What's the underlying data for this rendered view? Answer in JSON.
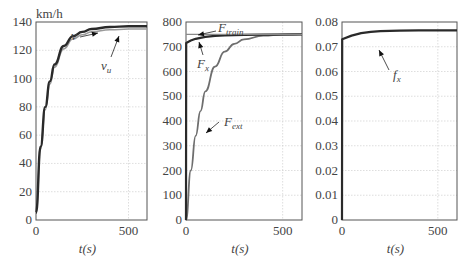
{
  "chart_data": [
    {
      "type": "line",
      "title": "",
      "ylabel": "km/h",
      "xlabel": "t(s)",
      "xlim": [
        0,
        600
      ],
      "ylim": [
        0,
        140
      ],
      "xticks": [
        "0",
        "500"
      ],
      "yticks": [
        "0",
        "20",
        "40",
        "60",
        "80",
        "100",
        "120",
        "140"
      ],
      "grid": true,
      "annotations": [
        "v",
        "v_u"
      ],
      "series": [
        {
          "name": "v",
          "x": [
            0,
            25,
            50,
            75,
            100,
            150,
            200,
            250,
            300,
            400,
            500,
            600
          ],
          "values": [
            5,
            52,
            80,
            98,
            110,
            123,
            130,
            133,
            135,
            136.5,
            137,
            137
          ]
        },
        {
          "name": "v_u",
          "x": [
            0,
            25,
            50,
            75,
            100,
            150,
            200,
            250,
            300,
            400,
            500,
            600
          ],
          "values": [
            5,
            50,
            78,
            96,
            108,
            121,
            128,
            131,
            133,
            134.5,
            135,
            135
          ]
        }
      ]
    },
    {
      "type": "line",
      "title": "",
      "ylabel": "",
      "xlabel": "t(s)",
      "xlim": [
        0,
        600
      ],
      "ylim": [
        0,
        800
      ],
      "xticks": [
        "0",
        "500"
      ],
      "yticks": [
        "0",
        "100",
        "200",
        "300",
        "400",
        "500",
        "600",
        "700",
        "800"
      ],
      "grid": true,
      "annotations": [
        "F_train",
        "F_x",
        "F_ext"
      ],
      "series": [
        {
          "name": "F_train",
          "x": [
            0,
            600
          ],
          "values": [
            750,
            750
          ]
        },
        {
          "name": "F_x",
          "x": [
            0,
            1,
            25,
            50,
            100,
            150,
            200,
            300,
            400,
            600
          ],
          "values": [
            0,
            715,
            725,
            732,
            740,
            744,
            746,
            748,
            749,
            750
          ]
        },
        {
          "name": "F_ext",
          "x": [
            0,
            25,
            50,
            75,
            100,
            150,
            200,
            250,
            300,
            400,
            500,
            600
          ],
          "values": [
            0,
            200,
            340,
            440,
            520,
            620,
            680,
            712,
            730,
            745,
            749,
            750
          ]
        }
      ]
    },
    {
      "type": "line",
      "title": "",
      "ylabel": "",
      "xlabel": "t(s)",
      "xlim": [
        0,
        600
      ],
      "ylim": [
        0,
        0.08
      ],
      "xticks": [
        "0",
        "500"
      ],
      "yticks": [
        "0",
        "0.01",
        "0.02",
        "0.03",
        "0.04",
        "0.05",
        "0.06",
        "0.07",
        "0.08"
      ],
      "grid": true,
      "annotations": [
        "f_x"
      ],
      "series": [
        {
          "name": "f_x",
          "x": [
            0,
            1,
            50,
            100,
            150,
            200,
            300,
            400,
            600
          ],
          "values": [
            0,
            0.073,
            0.0745,
            0.0755,
            0.076,
            0.0763,
            0.0765,
            0.0766,
            0.0766
          ]
        }
      ]
    }
  ],
  "charts": [
    {
      "unit": "km/h",
      "xlabel": "t(s)",
      "labels": {
        "a": "v",
        "b": "v",
        "b_sub": "u"
      }
    },
    {
      "xlabel": "t(s)",
      "labels": {
        "train": "F",
        "train_sub": "train",
        "x": "F",
        "x_sub": "x",
        "ext": "F",
        "ext_sub": "ext"
      }
    },
    {
      "xlabel": "t(s)",
      "labels": {
        "f": "f",
        "f_sub": "x"
      }
    }
  ]
}
